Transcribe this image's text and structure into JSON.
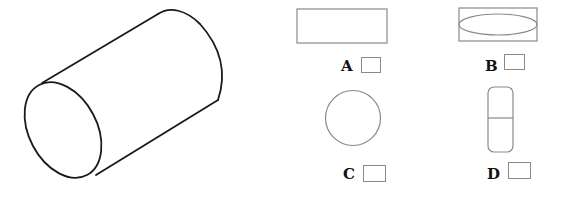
{
  "figure": {
    "main_shape": "cylinder",
    "stroke_color": "#1a1a1a",
    "option_stroke_color": "#8a8a8a"
  },
  "options": [
    {
      "label": "A",
      "shape": "rectangle"
    },
    {
      "label": "B",
      "shape": "rectangle-with-ellipse"
    },
    {
      "label": "C",
      "shape": "circle"
    },
    {
      "label": "D",
      "shape": "rounded-rectangle-with-divider"
    }
  ]
}
